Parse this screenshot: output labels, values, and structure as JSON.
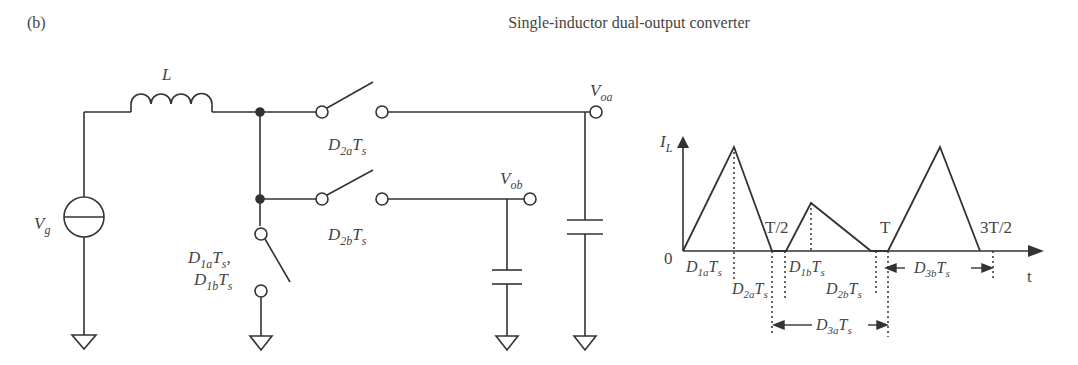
{
  "figure": {
    "panel_label": "(b)",
    "title": "Single-inductor dual-output converter"
  },
  "circuit": {
    "source_label": {
      "main": "V",
      "sub": "g"
    },
    "inductor_label": "L",
    "switch_2a_label": {
      "main": "D",
      "sub": "2a",
      "tail": "T",
      "tail_sub": "s"
    },
    "switch_2b_label": {
      "main": "D",
      "sub": "2b",
      "tail": "T",
      "tail_sub": "s"
    },
    "switch_1_label_line1": {
      "main": "D",
      "sub": "1a",
      "tail": "T",
      "tail_sub": "s",
      "suffix": ","
    },
    "switch_1_label_line2": {
      "main": "D",
      "sub": "1b",
      "tail": "T",
      "tail_sub": "s"
    },
    "output_a_label": {
      "main": "V",
      "sub": "oa"
    },
    "output_b_label": {
      "main": "V",
      "sub": "ob"
    }
  },
  "waveform": {
    "y_axis_label": {
      "main": "I",
      "sub": "L"
    },
    "x_axis_label": "t",
    "origin_label": "0",
    "time_markers": [
      "T/2",
      "T",
      "3T/2"
    ],
    "interval_labels": {
      "d1a": {
        "main": "D",
        "sub": "1a",
        "tail": "T",
        "tail_sub": "s"
      },
      "d2a": {
        "main": "D",
        "sub": "2a",
        "tail": "T",
        "tail_sub": "s"
      },
      "d1b": {
        "main": "D",
        "sub": "1b",
        "tail": "T",
        "tail_sub": "s"
      },
      "d2b": {
        "main": "D",
        "sub": "2b",
        "tail": "T",
        "tail_sub": "s"
      },
      "d3a": {
        "main": "D",
        "sub": "3a",
        "tail": "T",
        "tail_sub": "s"
      },
      "d3b": {
        "main": "D",
        "sub": "3b",
        "tail": "T",
        "tail_sub": "s"
      }
    }
  },
  "colors": {
    "line": "#333333",
    "text": "#444444",
    "background": "#ffffff"
  }
}
